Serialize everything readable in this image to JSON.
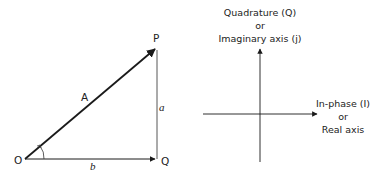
{
  "phasor_triangle": {
    "vertices": {
      "origin": "O",
      "tip": "P",
      "foot": "Q"
    },
    "sides": {
      "hypotenuse": "A",
      "vertical": "a",
      "horizontal": "b"
    },
    "angle_marker": "angle-arc-at-origin"
  },
  "iq_axes": {
    "vertical_axis": {
      "line1": "Quadrature (Q)",
      "line2": "or",
      "line3": "Imaginary axis (j)"
    },
    "horizontal_axis": {
      "line1": "In-phase (I)",
      "line2": "or",
      "line3": "Real axis"
    }
  },
  "colors": {
    "stroke": "#1a1a1a",
    "text": "#222222",
    "background": "#ffffff"
  }
}
